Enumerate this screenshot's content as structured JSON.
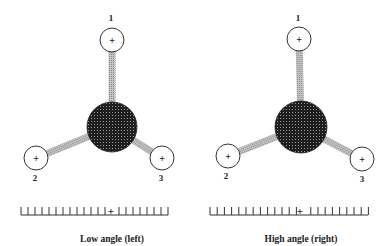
{
  "colors": {
    "atom_fill": "#2a2a2a",
    "bond_fill": "#a8a8a8",
    "outline": "#333333",
    "background": "#ffffff"
  },
  "panels": [
    {
      "id": "left",
      "caption": "Low angle (left)",
      "center_atom": {
        "cx": 112,
        "cy": 127,
        "r": 25
      },
      "substituents": [
        {
          "label": "1",
          "sign": "+",
          "cx": 112,
          "cy": 40,
          "r": 12,
          "label_x": 111,
          "label_y": 21
        },
        {
          "label": "2",
          "sign": "+",
          "cx": 36,
          "cy": 158,
          "r": 12,
          "label_x": 35,
          "label_y": 181
        },
        {
          "label": "3",
          "sign": "+",
          "cx": 162,
          "cy": 158,
          "r": 12,
          "label_x": 161,
          "label_y": 181
        }
      ],
      "scale": {
        "x_start": 21,
        "x_end": 168,
        "y": 209,
        "tick_spacing": 7,
        "plus_x": 111,
        "plus_sign": "+"
      }
    },
    {
      "id": "right",
      "caption": "High angle (right)",
      "center_atom": {
        "cx": 301,
        "cy": 127,
        "r": 26
      },
      "substituents": [
        {
          "label": "1",
          "sign": "+",
          "cx": 299,
          "cy": 39,
          "r": 12,
          "label_x": 298,
          "label_y": 21
        },
        {
          "label": "2",
          "sign": "+",
          "cx": 228,
          "cy": 156,
          "r": 12,
          "label_x": 226,
          "label_y": 179
        },
        {
          "label": "3",
          "sign": "+",
          "cx": 362,
          "cy": 159,
          "r": 12,
          "label_x": 362,
          "label_y": 182
        }
      ],
      "scale": {
        "x_start": 210,
        "x_end": 368,
        "y": 209,
        "tick_spacing": 7.2,
        "plus_x": 300,
        "plus_sign": "+"
      }
    }
  ]
}
